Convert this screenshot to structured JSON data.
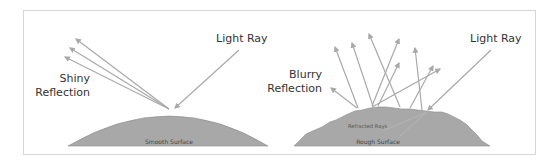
{
  "diagram": {
    "colors": {
      "surface_fill": "#a8a8a8",
      "surface_stroke": "#8c8c8c",
      "ray": "#a9a9a9",
      "frame": "#d6d6d6",
      "text": "#333333"
    },
    "left_panel": {
      "incident_label": "Light Ray",
      "reflection_label_line1": "Shiny",
      "reflection_label_line2": "Reflection",
      "surface_label": "Smooth Surface"
    },
    "right_panel": {
      "incident_label": "Light Ray",
      "reflection_label_line1": "Blurry",
      "reflection_label_line2": "Reflection",
      "refracted_label": "Refracted Rays",
      "surface_label": "Rough Surface"
    }
  }
}
